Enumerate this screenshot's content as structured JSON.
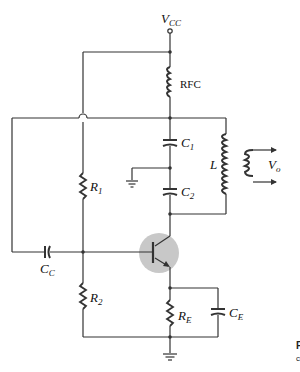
{
  "diagram": {
    "type": "circuit-schematic",
    "colors": {
      "line": "#333333",
      "transistor_highlight": "#c8c8c8",
      "background": "#ffffff"
    },
    "labels": {
      "vcc_main": "V",
      "vcc_sub": "CC",
      "rfc": "RFC",
      "c1_main": "C",
      "c1_sub": "1",
      "c2_main": "C",
      "c2_sub": "2",
      "l": "L",
      "vo_main": "V",
      "vo_sub": "o",
      "r1_main": "R",
      "r1_sub": "1",
      "r2_main": "R",
      "r2_sub": "2",
      "cc_main": "C",
      "cc_sub": "C",
      "re_main": "R",
      "re_sub": "E",
      "ce_main": "C",
      "ce_sub": "E"
    },
    "edge_text": {
      "line1": "F",
      "line2": "c"
    },
    "components": [
      {
        "id": "VCC",
        "type": "supply-terminal"
      },
      {
        "id": "RFC",
        "type": "inductor",
        "role": "RF choke"
      },
      {
        "id": "C1",
        "type": "capacitor"
      },
      {
        "id": "C2",
        "type": "capacitor"
      },
      {
        "id": "L",
        "type": "inductor",
        "role": "tank / transformer primary"
      },
      {
        "id": "Lsec",
        "type": "inductor",
        "role": "transformer secondary"
      },
      {
        "id": "R1",
        "type": "resistor"
      },
      {
        "id": "R2",
        "type": "resistor"
      },
      {
        "id": "CC",
        "type": "capacitor",
        "role": "coupling"
      },
      {
        "id": "Q1",
        "type": "npn-transistor"
      },
      {
        "id": "RE",
        "type": "resistor"
      },
      {
        "id": "CE",
        "type": "capacitor",
        "role": "emitter bypass"
      },
      {
        "id": "GND1",
        "type": "ground"
      },
      {
        "id": "GND2",
        "type": "ground"
      }
    ]
  }
}
